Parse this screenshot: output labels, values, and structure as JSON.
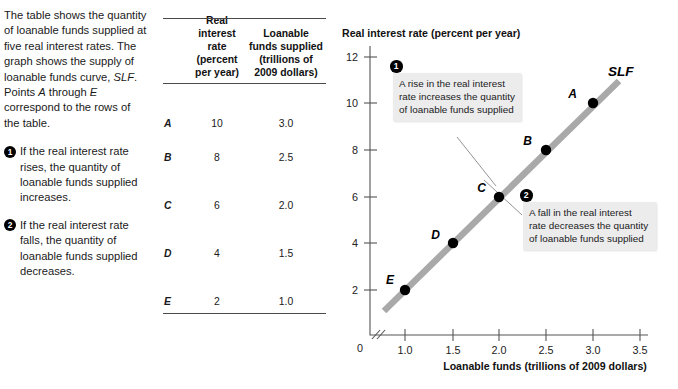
{
  "left_column": {
    "intro": "The table shows the quantity of loanable funds supplied at five real interest rates. The graph shows the supply of loanable funds curve, SLF. Points A through E correspond to the rows of the table.",
    "notes": [
      {
        "number": "1",
        "text": "If the real interest rate rises, the quantity of loanable funds supplied increases."
      },
      {
        "number": "2",
        "text": "If the real interest rate falls, the quantity of loanable funds supplied decreases."
      }
    ]
  },
  "table": {
    "headers": {
      "row_label": "",
      "rate": "Real interest rate (percent per year)",
      "rate_lines": [
        "Real",
        "interest rate",
        "(percent",
        "per year)"
      ],
      "funds": "Loanable funds supplied (trillions of 2009 dollars)",
      "funds_lines": [
        "Loanable",
        "funds supplied",
        "(trillions of",
        "2009 dollars)"
      ]
    },
    "rows": [
      {
        "label": "A",
        "rate": "10",
        "funds": "3.0"
      },
      {
        "label": "B",
        "rate": "8",
        "funds": "2.5"
      },
      {
        "label": "C",
        "rate": "6",
        "funds": "2.0"
      },
      {
        "label": "D",
        "rate": "4",
        "funds": "1.5"
      },
      {
        "label": "E",
        "rate": "2",
        "funds": "1.0"
      }
    ]
  },
  "graph": {
    "y_axis_title": "Real interest rate (percent per year)",
    "x_axis_title": "Loanable funds (trillions of 2009 dollars)",
    "origin_label": "0",
    "curve_label": "SLF",
    "y_ticks": [
      "2",
      "4",
      "6",
      "8",
      "10",
      "12"
    ],
    "x_ticks": [
      "1.0",
      "1.5",
      "2.0",
      "2.5",
      "3.0",
      "3.5"
    ],
    "callouts": [
      {
        "number": "1",
        "text": "A rise in the real interest rate increases the quantity of loanable funds supplied"
      },
      {
        "number": "2",
        "text": "A fall in the real interest rate decreases the quantity of loanable funds supplied"
      }
    ],
    "colors": {
      "curve": "#a9a9a9",
      "point": "#000000",
      "axis": "#555555",
      "callout_background": "#ececed"
    }
  },
  "chart_data": {
    "type": "line",
    "title": "",
    "xlabel": "Loanable funds (trillions of 2009 dollars)",
    "ylabel": "Real interest rate (percent per year)",
    "xlim": [
      0.75,
      3.5
    ],
    "ylim": [
      0,
      12
    ],
    "xticks": [
      1.0,
      1.5,
      2.0,
      2.5,
      3.0,
      3.5
    ],
    "yticks": [
      2,
      4,
      6,
      8,
      10,
      12
    ],
    "grid": false,
    "legend": "none",
    "axis_break_x": true,
    "series": [
      {
        "name": "SLF",
        "x": [
          1.0,
          1.5,
          2.0,
          2.5,
          3.0
        ],
        "y": [
          2,
          4,
          6,
          8,
          10
        ],
        "point_labels": [
          "E",
          "D",
          "C",
          "B",
          "A"
        ]
      }
    ],
    "annotations": [
      "A rise in the real interest rate increases the quantity of loanable funds supplied",
      "A fall in the real interest rate decreases the quantity of loanable funds supplied"
    ]
  }
}
